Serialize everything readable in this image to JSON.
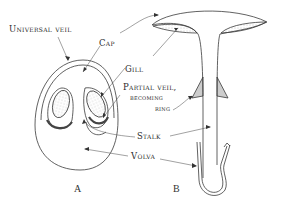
{
  "diagram": {
    "labels": {
      "universal_veil": "Universal veil",
      "cap": "Cap",
      "gill": "Gill",
      "partial_veil_line1": "Partial veil,",
      "partial_veil_line2": "becoming",
      "partial_veil_line3": "ring",
      "stalk": "Stalk",
      "volva": "Volva"
    },
    "figures": {
      "a": "A",
      "b": "B"
    },
    "colors": {
      "line": "#3a3a3a",
      "stipple": "#bdbdbd",
      "background": "#ffffff"
    }
  }
}
